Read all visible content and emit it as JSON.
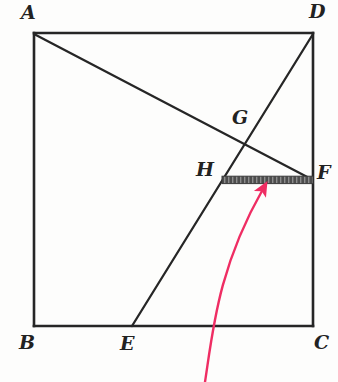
{
  "figure": {
    "kind": "geometry-diagram",
    "canvas": {
      "width": 338,
      "height": 382
    },
    "background_color": "#fdfdfc",
    "ink_color": "#262626",
    "highlight_color": "#4d4d4d",
    "arrow_color": "#ef2d63"
  },
  "square": {
    "name": "ABCD",
    "corners": {
      "A": {
        "x": 34,
        "y": 33
      },
      "D": {
        "x": 313,
        "y": 33
      },
      "C": {
        "x": 313,
        "y": 326
      },
      "B": {
        "x": 34,
        "y": 326
      }
    },
    "stroke_width": 2.6,
    "side_px": 279
  },
  "points": {
    "A": {
      "x": 34,
      "y": 33,
      "label": "A",
      "label_x": 21,
      "label_y": 3
    },
    "B": {
      "x": 34,
      "y": 326,
      "label": "B",
      "label_x": 19,
      "label_y": 333
    },
    "C": {
      "x": 313,
      "y": 326,
      "label": "C",
      "label_x": 314,
      "label_y": 333
    },
    "D": {
      "x": 313,
      "y": 33,
      "label": "D",
      "label_x": 309,
      "label_y": 2
    },
    "E": {
      "x": 132,
      "y": 326,
      "label": "E",
      "label_x": 120,
      "label_y": 334
    },
    "F": {
      "x": 313,
      "y": 180,
      "label": "F",
      "label_x": 317,
      "label_y": 163
    },
    "G": {
      "x": 244,
      "y": 144,
      "label": "G",
      "label_x": 232,
      "label_y": 108
    },
    "H": {
      "x": 222,
      "y": 180,
      "label": "H",
      "label_x": 196,
      "label_y": 160
    }
  },
  "segments": [
    {
      "name": "side-AD",
      "from": "A",
      "to": "D",
      "style": "thin"
    },
    {
      "name": "side-DC",
      "from": "D",
      "to": "C",
      "style": "thin"
    },
    {
      "name": "side-CB",
      "from": "C",
      "to": "B",
      "style": "thin"
    },
    {
      "name": "side-BA",
      "from": "B",
      "to": "A",
      "style": "thin"
    },
    {
      "name": "cevian-AF",
      "from": "A",
      "to": "F",
      "style": "thin"
    },
    {
      "name": "cevian-ED",
      "from": "E",
      "to": "D",
      "style": "thin"
    },
    {
      "name": "highlighted-HF",
      "from": "H",
      "to": "F",
      "style": "thick-shaded"
    }
  ],
  "annotation_arrow": {
    "name": "pointer-arrow",
    "color": "#ef2d63",
    "tail": {
      "x": 205,
      "y": 382
    },
    "control": {
      "x": 228,
      "y": 262
    },
    "tip": {
      "x": 263,
      "y": 189
    },
    "points_at": "highlighted-HF"
  },
  "labels": {
    "A": "A",
    "B": "B",
    "C": "C",
    "D": "D",
    "E": "E",
    "F": "F",
    "G": "G",
    "H": "H"
  }
}
